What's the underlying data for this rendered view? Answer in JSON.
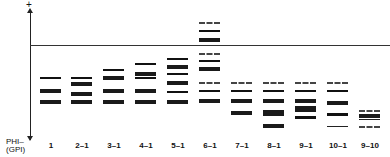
{
  "diagram": {
    "axis_plus": "+",
    "phi_label": "PHI",
    "gpi_label": "(GPI)",
    "minus": "–"
  },
  "lanes": [
    {
      "label": "1",
      "x": 50
    },
    {
      "label": "2–1",
      "x": 82
    },
    {
      "label": "3–1",
      "x": 114
    },
    {
      "label": "4–1",
      "x": 146
    },
    {
      "label": "5–1",
      "x": 178
    },
    {
      "label": "6–1",
      "x": 210
    },
    {
      "label": "7–1",
      "x": 242
    },
    {
      "label": "8–1",
      "x": 274
    },
    {
      "label": "9–1",
      "x": 306
    },
    {
      "label": "10–1",
      "x": 338
    },
    {
      "label": "9–10",
      "x": 370
    }
  ]
}
